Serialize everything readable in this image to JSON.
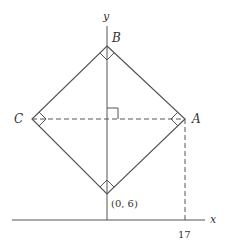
{
  "diagram": {
    "axes": {
      "x_label": "x",
      "y_label": "y"
    },
    "vertices": {
      "top": {
        "label": "B"
      },
      "left": {
        "label": "C"
      },
      "right": {
        "label": "A"
      },
      "bottom": {
        "label": "(0, 6)"
      }
    },
    "tick_label_x": "17",
    "colors": {
      "stroke": "#555555",
      "text": "#333333"
    }
  }
}
